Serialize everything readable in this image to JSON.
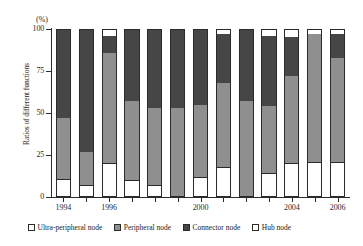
{
  "chart_data": {
    "type": "bar",
    "stacked": true,
    "title": "",
    "subtitle": "",
    "unit_label": "(%)",
    "xlabel": "",
    "ylabel": "Ratios of different functions",
    "ylim": [
      0,
      100
    ],
    "yticks": [
      0,
      25,
      50,
      75,
      100
    ],
    "ytick_labels": [
      "0",
      "25",
      "50",
      "75",
      "100"
    ],
    "grid": false,
    "legend_position": "bottom",
    "categories": [
      1994,
      1995,
      1996,
      1997,
      1998,
      1999,
      2000,
      2001,
      2002,
      2003,
      2004,
      2005,
      2006
    ],
    "xtick_labels": [
      "1994",
      "1996",
      "2000",
      "2004",
      "2006"
    ],
    "xtick_categories": [
      1994,
      1996,
      2000,
      2004,
      2006
    ],
    "series": [
      {
        "name": "Ultra-peripheral node",
        "color": "#ffffff",
        "values": [
          11,
          7,
          20,
          10,
          7,
          0,
          12,
          18,
          0,
          14,
          20,
          21,
          21
        ]
      },
      {
        "name": "Peripheral node",
        "color": "#8f8f8f",
        "values": [
          36,
          20,
          66,
          47,
          46,
          53,
          43,
          50,
          57,
          40,
          52,
          76,
          62
        ]
      },
      {
        "name": "Connector node",
        "color": "#464646",
        "values": [
          53,
          73,
          10,
          43,
          47,
          47,
          45,
          29,
          43,
          42,
          23,
          0,
          14
        ]
      },
      {
        "name": "Hub node",
        "color": "#ffffff",
        "values": [
          0,
          0,
          4,
          0,
          0,
          0,
          0,
          3,
          0,
          4,
          5,
          3,
          3
        ]
      }
    ]
  }
}
